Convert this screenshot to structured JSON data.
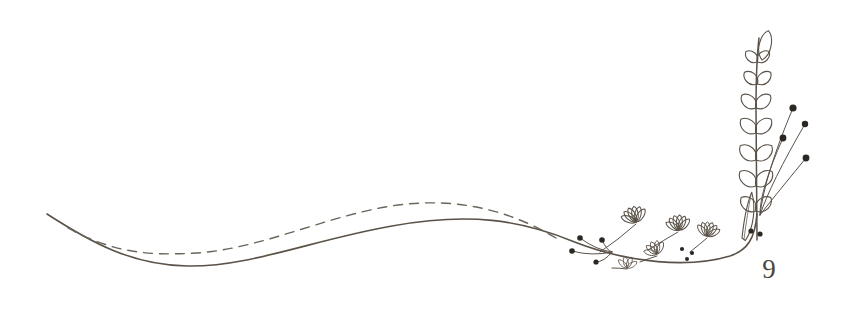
{
  "document": {
    "type": "decorative-page-ornament",
    "title": "Botanical line-art divider with page number",
    "page_number": "9",
    "background_color": "#ffffff"
  },
  "colors": {
    "ink": "#5a5248",
    "ink_light": "#6b645a",
    "berry_fill": "#2b2823",
    "page_number": "#4a443c"
  },
  "strokes": {
    "solid_swash_width": 1.6,
    "dashed_swash_width": 1.4,
    "dash_pattern": "9 7",
    "stem_width": 1.5,
    "leaf_width": 1.1,
    "petal_width": 1.0,
    "sprig_width": 1.0
  },
  "artwork": {
    "solid_swash": {
      "name": "solid-flourish-line",
      "path": "M 47 214 C 92 243 132 265 187 266 C 250 267 312 240 392 226 C 470 212 520 220 572 241 C 630 264 690 268 730 256 C 748 250 755 238 757 214"
    },
    "dashed_swash": {
      "name": "dashed-flourish-line",
      "path": "M 68 228 C 112 252 146 256 196 253 C 262 249 330 214 398 205 C 462 197 512 212 556 238"
    },
    "main_stem": {
      "name": "vertical-main-stem",
      "path": "M 757 240 C 757 200 756 150 756 110 C 756 80 757 55 759 38"
    },
    "leaf_pairs": [
      {
        "y": 62,
        "scale": 0.78
      },
      {
        "y": 84,
        "scale": 0.88
      },
      {
        "y": 108,
        "scale": 0.96
      },
      {
        "y": 133,
        "scale": 1.02
      },
      {
        "y": 160,
        "scale": 1.06
      },
      {
        "y": 186,
        "scale": 1.08
      },
      {
        "y": 211,
        "scale": 1.0
      }
    ],
    "tip_leaf": {
      "name": "stem-tip-leaf",
      "x": 762,
      "y": 34
    },
    "large_lower_leaf": {
      "name": "large-lower-leaf",
      "x": 742,
      "y": 212
    },
    "berry_sprigs": [
      {
        "name": "berry-sprig-1",
        "tip_x": 793,
        "tip_y": 108,
        "r": 3.6
      },
      {
        "name": "berry-sprig-2",
        "tip_x": 805,
        "tip_y": 124,
        "r": 3.2
      },
      {
        "name": "berry-sprig-3",
        "tip_x": 783,
        "tip_y": 138,
        "r": 3.4
      },
      {
        "name": "berry-sprig-4",
        "tip_x": 806,
        "tip_y": 158,
        "r": 3.4
      }
    ],
    "fan_flowers": [
      {
        "name": "fan-flower-1",
        "x": 636,
        "y": 222,
        "rot": -18,
        "scale": 1.05,
        "petals": 6
      },
      {
        "name": "fan-flower-2",
        "x": 679,
        "y": 230,
        "rot": -8,
        "scale": 1.0,
        "petals": 6
      },
      {
        "name": "fan-flower-3",
        "x": 707,
        "y": 236,
        "rot": 12,
        "scale": 0.95,
        "petals": 6
      },
      {
        "name": "fan-flower-4",
        "x": 657,
        "y": 254,
        "rot": -26,
        "scale": 0.9,
        "petals": 5
      },
      {
        "name": "fan-flower-5",
        "x": 627,
        "y": 268,
        "rot": 6,
        "scale": 0.78,
        "petals": 4
      }
    ],
    "small_berry_cluster": {
      "name": "left-berry-cluster",
      "berries": [
        {
          "x": 580,
          "y": 238,
          "r": 2.8
        },
        {
          "x": 572,
          "y": 251,
          "r": 2.8
        },
        {
          "x": 596,
          "y": 262,
          "r": 2.6
        },
        {
          "x": 602,
          "y": 240,
          "r": 2.8
        }
      ]
    },
    "speckle_dots": [
      {
        "x": 682,
        "y": 249,
        "r": 2.1
      },
      {
        "x": 692,
        "y": 253,
        "r": 2.1
      },
      {
        "x": 687,
        "y": 259,
        "r": 2.0
      },
      {
        "x": 751,
        "y": 231,
        "r": 2.6
      },
      {
        "x": 760,
        "y": 234,
        "r": 2.6
      }
    ]
  }
}
